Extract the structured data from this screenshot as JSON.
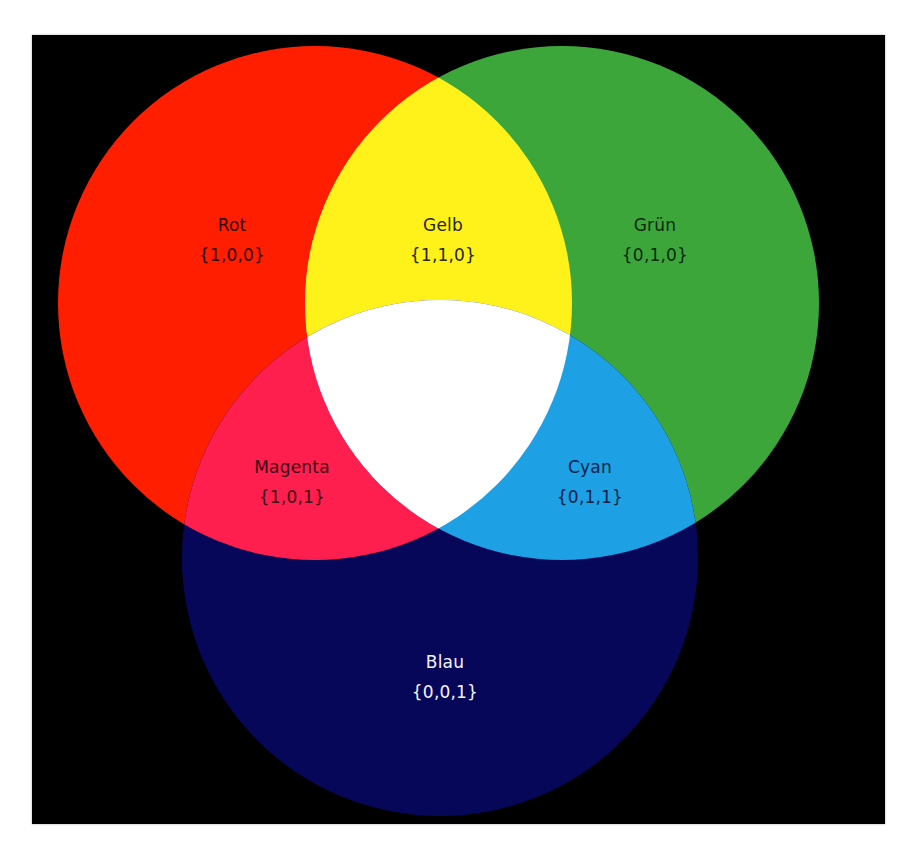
{
  "diagram": {
    "type": "venn",
    "background_color": "#000000",
    "sets": [
      {
        "id": "rot",
        "name": "Rot",
        "rgb_set": "{1,0,0}",
        "color": "#ff1e00",
        "cx": 315,
        "cy": 303,
        "r": 257
      },
      {
        "id": "gruen",
        "name": "Grün",
        "rgb_set": "{0,1,0}",
        "color": "#3da63b",
        "cx": 562,
        "cy": 303,
        "r": 257
      },
      {
        "id": "blau",
        "name": "Blau",
        "rgb_set": "{0,0,1}",
        "color": "#07075a",
        "cx": 440,
        "cy": 558,
        "r": 258
      }
    ],
    "intersections": [
      {
        "id": "gelb",
        "name": "Gelb",
        "rgb_set": "{1,1,0}",
        "color": "#fff21a",
        "of": [
          "rot",
          "gruen"
        ]
      },
      {
        "id": "magenta",
        "name": "Magenta",
        "rgb_set": "{1,0,1}",
        "color": "#ff1f4e",
        "of": [
          "rot",
          "blau"
        ]
      },
      {
        "id": "cyan",
        "name": "Cyan",
        "rgb_set": "{0,1,1}",
        "color": "#1ea0e4",
        "of": [
          "gruen",
          "blau"
        ]
      },
      {
        "id": "weiss",
        "name": "",
        "rgb_set": "",
        "color": "#ffffff",
        "of": [
          "rot",
          "gruen",
          "blau"
        ]
      }
    ]
  },
  "labels": {
    "rot": {
      "name": "Rot",
      "set": "{1,0,0}",
      "x": 232,
      "y": 240,
      "color": "#2a0500"
    },
    "gelb": {
      "name": "Gelb",
      "set": "{1,1,0}",
      "x": 443,
      "y": 240,
      "color": "#2a2600"
    },
    "gruen": {
      "name": "Grün",
      "set": "{0,1,0}",
      "x": 655,
      "y": 240,
      "color": "#082a0a"
    },
    "magenta": {
      "name": "Magenta",
      "set": "{1,0,1}",
      "x": 292,
      "y": 482,
      "color": "#3a0414"
    },
    "cyan": {
      "name": "Cyan",
      "set": "{0,1,1}",
      "x": 590,
      "y": 482,
      "color": "#06204a"
    },
    "blau": {
      "name": "Blau",
      "set": "{0,0,1}",
      "x": 445,
      "y": 677,
      "color": "#f4f4ff"
    }
  }
}
